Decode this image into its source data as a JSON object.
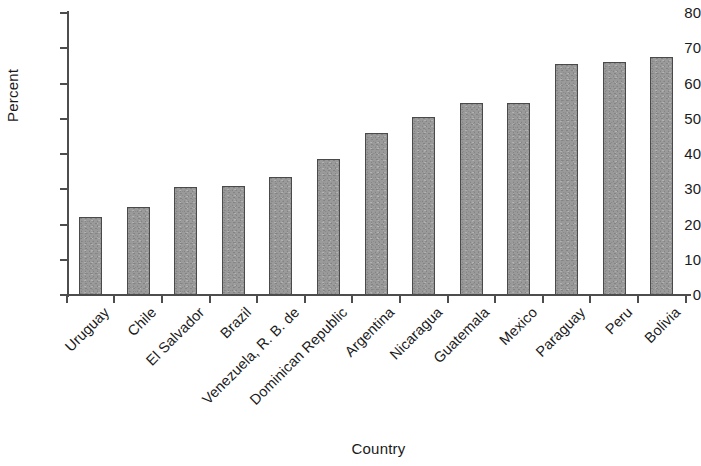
{
  "chart_data": {
    "type": "bar",
    "title": "",
    "xlabel": "Country",
    "ylabel": "Percent",
    "categories": [
      "Uruguay",
      "Chile",
      "El Salvador",
      "Brazil",
      "Venezuela, R. B. de",
      "Dominican Republic",
      "Argentina",
      "Nicaragua",
      "Guatemala",
      "Mexico",
      "Paraguay",
      "Peru",
      "Bolivia"
    ],
    "values": [
      22,
      25,
      30.5,
      31,
      33.5,
      38.5,
      46,
      50.5,
      54.5,
      54.5,
      65.5,
      66,
      67.5
    ],
    "ylim": [
      0,
      80
    ],
    "yticks": [
      0,
      10,
      20,
      30,
      40,
      50,
      60,
      70,
      80
    ],
    "ytick_labels": [
      "0",
      "10",
      "20",
      "30",
      "40",
      "50",
      "60",
      "70",
      "80"
    ],
    "grid": false,
    "legend": false,
    "bar_color": "#9a9a9a",
    "bar_edge_color": "#4a4a4a",
    "axis_color": "#4d4d4d"
  }
}
